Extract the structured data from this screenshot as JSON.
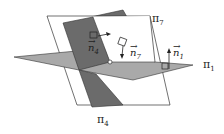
{
  "diagram": {
    "type": "intersecting-planes",
    "planes": [
      {
        "id": "pi7",
        "label": "π",
        "sub": "7",
        "fill": "#ffffff",
        "stroke": "#333333"
      },
      {
        "id": "pi4",
        "label": "π",
        "sub": "4",
        "fill": "#6b6b6b",
        "stroke": "#333333"
      },
      {
        "id": "pi1",
        "label": "π",
        "sub": "1",
        "fill": "#a9a9a9",
        "stroke": "#333333"
      }
    ],
    "normals": [
      {
        "id": "n4",
        "label": "n",
        "sub": "4"
      },
      {
        "id": "n7",
        "label": "n",
        "sub": "7"
      },
      {
        "id": "n1",
        "label": "n",
        "sub": "1"
      }
    ],
    "arrow_glyph": "→",
    "intersection_point": "common point of three planes"
  }
}
